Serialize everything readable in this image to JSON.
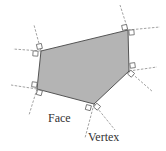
{
  "diagram": {
    "labels": {
      "face": "Face",
      "vertex": "Vertex"
    },
    "colors": {
      "face_fill": "#b4b4b4",
      "edge": "#555555",
      "dashed": "#8a8a8a",
      "text": "#333333"
    },
    "polygon": {
      "vertices": [
        [
          41,
          51
        ],
        [
          128,
          30
        ],
        [
          129,
          71
        ],
        [
          94,
          104
        ],
        [
          37,
          89
        ]
      ]
    }
  }
}
